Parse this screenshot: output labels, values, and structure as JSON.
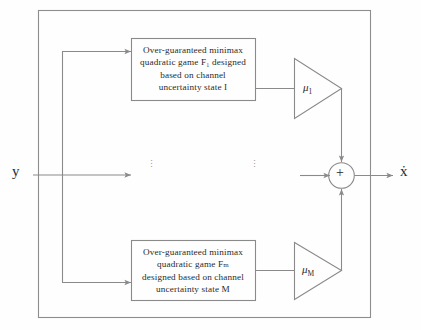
{
  "diagram": {
    "input_label": "y",
    "output_label": "ẋ",
    "sum_symbol": "+",
    "vertical_ellipsis": "⋮",
    "branches": [
      {
        "id": "branch-1",
        "block_lines": [
          "Over-guaranteed minimax",
          "quadratic game F₁ designed",
          "based on channel",
          "uncertainty state I"
        ],
        "block_text": "Over-guaranteed minimax quadratic game F1 designed based on channel uncertainty state I",
        "gain_label": "μ",
        "gain_subscript": "1",
        "state_index": "I"
      },
      {
        "id": "branch-M",
        "block_lines": [
          "Over-guaranteed minimax",
          "quadratic game Fₘ",
          "designed based on channel",
          "uncertainty state M"
        ],
        "block_text": "Over-guaranteed minimax quadratic game FM designed based on channel uncertainty state M",
        "gain_label": "μ",
        "gain_subscript": "M",
        "state_index": "M"
      }
    ],
    "colors": {
      "line": "#8a8a8a",
      "text": "#2b2b2b",
      "background": "#fefefe",
      "outer_border": "#7d7d7d"
    }
  }
}
